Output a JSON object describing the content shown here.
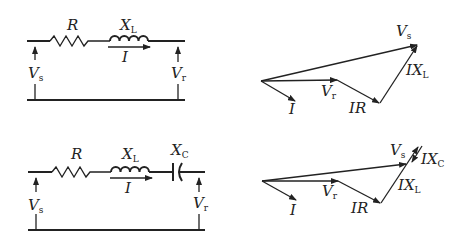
{
  "circuits": [
    {
      "id": "rl",
      "labels": {
        "resistor": "R",
        "inductor_main": "X",
        "inductor_sub": "L",
        "current": "I",
        "vs_main": "V",
        "vs_sub": "s",
        "vr_main": "V",
        "vr_sub": "r"
      }
    },
    {
      "id": "rlc",
      "labels": {
        "resistor": "R",
        "inductor_main": "X",
        "inductor_sub": "L",
        "capacitor_main": "X",
        "capacitor_sub": "C",
        "current": "I",
        "vs_main": "V",
        "vs_sub": "s",
        "vr_main": "V",
        "vr_sub": "r"
      }
    }
  ],
  "phasors": [
    {
      "id": "rl",
      "labels": {
        "vs_main": "V",
        "vs_sub": "s",
        "vr_main": "V",
        "vr_sub": "r",
        "current": "I",
        "ir": "IR",
        "ixl_main": "IX",
        "ixl_sub": "L"
      }
    },
    {
      "id": "rlc",
      "labels": {
        "vs_main": "V",
        "vs_sub": "s",
        "vr_main": "V",
        "vr_sub": "r",
        "current": "I",
        "ir": "IR",
        "ixl_main": "IX",
        "ixl_sub": "L",
        "ixc_main": "IX",
        "ixc_sub": "C"
      }
    }
  ]
}
